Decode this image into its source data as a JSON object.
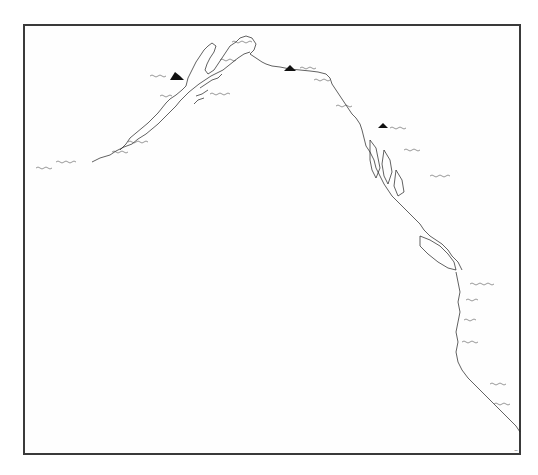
{
  "map": {
    "type": "historical hand-drawn coastline chart",
    "region": "North Pacific coast — Aleutian arc through Alaska to the northwest coast of America",
    "frame": {
      "left": 23,
      "top": 24,
      "right": 521,
      "bottom": 455,
      "color": "#3a3a3a"
    },
    "ink_color": "#1e1e1e",
    "paper_color": "#fefefe",
    "symbols": [
      {
        "name": "mountain-icon",
        "x": 176,
        "y": 76
      },
      {
        "name": "mountain-icon",
        "x": 290,
        "y": 68
      },
      {
        "name": "mountain-icon",
        "x": 383,
        "y": 125
      }
    ],
    "labels_legible": false,
    "signature_mark": "~"
  }
}
